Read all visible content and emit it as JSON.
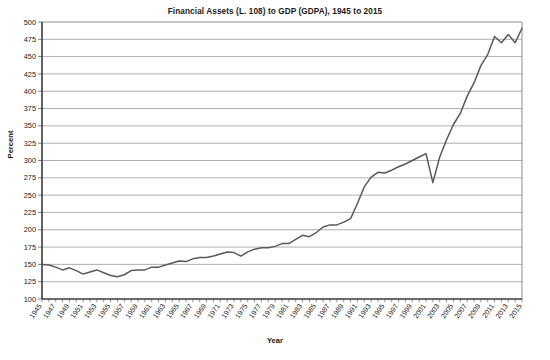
{
  "chart_data": {
    "type": "line",
    "title": "Financial Assets (L. 108) to GDP (GDPA), 1945 to 2015",
    "xlabel": "Year",
    "ylabel": "Percent",
    "grid": true,
    "legend": false,
    "xlim": [
      1945,
      2015
    ],
    "ylim": [
      100,
      500
    ],
    "ytick_labels": [
      "500",
      "475",
      "450",
      "425",
      "400",
      "375",
      "350",
      "325",
      "300",
      "275",
      "250",
      "225",
      "200",
      "175",
      "150",
      "125",
      "100"
    ],
    "ytick_values": [
      500,
      475,
      450,
      425,
      400,
      375,
      350,
      325,
      300,
      275,
      250,
      225,
      200,
      175,
      150,
      125,
      100
    ],
    "xtick_labels": [
      "1945",
      "1947",
      "1949",
      "1951",
      "1953",
      "1955",
      "1957",
      "1959",
      "1961",
      "1963",
      "1965",
      "1967",
      "1969",
      "1971",
      "1973",
      "1975",
      "1977",
      "1979",
      "1981",
      "1983",
      "1985",
      "1987",
      "1989",
      "1991",
      "1993",
      "1995",
      "1997",
      "1999",
      "2001",
      "2003",
      "2005",
      "2007",
      "2009",
      "2011",
      "2013",
      "2015"
    ],
    "xtick_values": [
      1945,
      1947,
      1949,
      1951,
      1953,
      1955,
      1957,
      1959,
      1961,
      1963,
      1965,
      1967,
      1969,
      1971,
      1973,
      1975,
      1977,
      1979,
      1981,
      1983,
      1985,
      1987,
      1989,
      1991,
      1993,
      1995,
      1997,
      1999,
      2001,
      2003,
      2005,
      2007,
      2009,
      2011,
      2013,
      2015
    ],
    "series": [
      {
        "name": "Financial Assets (L. 108) to GDP (GDPA)",
        "color": "#595959",
        "x": [
          1945,
          1946,
          1947,
          1948,
          1949,
          1950,
          1951,
          1952,
          1953,
          1954,
          1955,
          1956,
          1957,
          1958,
          1959,
          1960,
          1961,
          1962,
          1963,
          1964,
          1965,
          1966,
          1967,
          1968,
          1969,
          1970,
          1971,
          1972,
          1973,
          1974,
          1975,
          1976,
          1977,
          1978,
          1979,
          1980,
          1981,
          1982,
          1983,
          1984,
          1985,
          1986,
          1987,
          1988,
          1989,
          1990,
          1991,
          1992,
          1993,
          1994,
          1995,
          1996,
          1997,
          1998,
          1999,
          2000,
          2001,
          2002,
          2003,
          2004,
          2005,
          2006,
          2007,
          2008,
          2009,
          2010,
          2011,
          2012,
          2013,
          2014,
          2015
        ],
        "values": [
          150,
          149,
          146,
          142,
          145,
          141,
          136,
          139,
          142,
          138,
          134,
          132,
          135,
          141,
          142,
          142,
          146,
          146,
          149,
          152,
          155,
          154,
          158,
          160,
          160,
          162,
          165,
          168,
          167,
          162,
          168,
          172,
          174,
          174,
          176,
          180,
          180,
          186,
          192,
          190,
          196,
          204,
          207,
          207,
          211,
          216,
          238,
          262,
          276,
          283,
          282,
          286,
          291,
          295,
          300,
          305,
          310,
          268,
          305,
          330,
          352,
          368,
          393,
          412,
          437,
          453,
          479,
          470,
          482,
          470,
          491
        ]
      }
    ]
  },
  "axis": {
    "y_axis_title": "Percent",
    "x_axis_title": "Year"
  }
}
